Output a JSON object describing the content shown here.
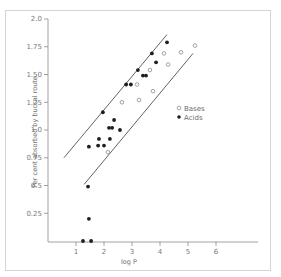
{
  "chart_data": {
    "type": "scatter",
    "title": "",
    "xlabel": "log P",
    "ylabel": "Per cent absorbed by buccal route",
    "xlim": [
      0,
      6.5
    ],
    "ylim": [
      0,
      2.0
    ],
    "x_ticks": [
      "1",
      "2",
      "3",
      "4",
      "5",
      "6"
    ],
    "y_ticks": [
      "0.25",
      "0.5",
      "0.75",
      "1.0",
      "1.25",
      "1.50",
      "1.75",
      "2.0"
    ],
    "grid": false,
    "legend_position": "right-middle",
    "legend": [
      {
        "label": "Bases",
        "marker": "open-circle"
      },
      {
        "label": "Acids",
        "marker": "filled-circle"
      }
    ],
    "series": [
      {
        "name": "Bases",
        "marker": "open-circle",
        "points": [
          {
            "x": 2.14,
            "y": 0.8
          },
          {
            "x": 2.64,
            "y": 1.25
          },
          {
            "x": 3.25,
            "y": 1.27
          },
          {
            "x": 3.18,
            "y": 1.41
          },
          {
            "x": 3.75,
            "y": 1.35
          },
          {
            "x": 3.64,
            "y": 1.54
          },
          {
            "x": 4.29,
            "y": 1.59
          },
          {
            "x": 4.14,
            "y": 1.69
          },
          {
            "x": 4.75,
            "y": 1.7
          },
          {
            "x": 5.25,
            "y": 1.76
          }
        ]
      },
      {
        "name": "Acids",
        "marker": "filled-circle",
        "points": [
          {
            "x": 1.25,
            "y": 0.0
          },
          {
            "x": 1.54,
            "y": 0.0
          },
          {
            "x": 1.46,
            "y": 0.2
          },
          {
            "x": 1.43,
            "y": 0.49
          },
          {
            "x": 1.46,
            "y": 0.85
          },
          {
            "x": 1.79,
            "y": 0.86
          },
          {
            "x": 2.0,
            "y": 0.86
          },
          {
            "x": 1.82,
            "y": 0.92
          },
          {
            "x": 2.21,
            "y": 0.92
          },
          {
            "x": 2.18,
            "y": 1.02
          },
          {
            "x": 2.29,
            "y": 1.02
          },
          {
            "x": 2.57,
            "y": 1.0
          },
          {
            "x": 2.36,
            "y": 1.09
          },
          {
            "x": 1.96,
            "y": 1.16
          },
          {
            "x": 2.79,
            "y": 1.41
          },
          {
            "x": 2.96,
            "y": 1.41
          },
          {
            "x": 3.39,
            "y": 1.49
          },
          {
            "x": 3.5,
            "y": 1.49
          },
          {
            "x": 3.21,
            "y": 1.54
          },
          {
            "x": 3.86,
            "y": 1.61
          },
          {
            "x": 3.71,
            "y": 1.69
          },
          {
            "x": 4.25,
            "y": 1.79
          }
        ]
      }
    ],
    "annotations": [
      {
        "type": "line",
        "name": "upper-bound",
        "from": {
          "x": 0.57,
          "y": 0.75
        },
        "to": {
          "x": 4.25,
          "y": 1.86
        }
      },
      {
        "type": "line",
        "name": "lower-bound",
        "from": {
          "x": 1.29,
          "y": 0.51
        },
        "to": {
          "x": 5.18,
          "y": 1.69
        }
      }
    ]
  },
  "colors": {
    "axis": "#8a8a8a",
    "bases_stroke": "#8a8a8a",
    "acids_fill": "#1e1e1e",
    "line": "#3a3a3a",
    "frame": "#d4d4d4"
  }
}
